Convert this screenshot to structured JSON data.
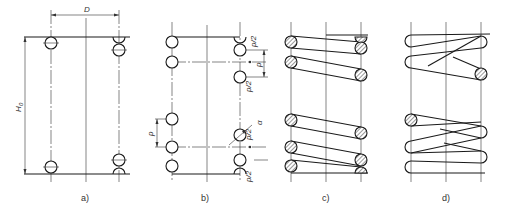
{
  "figure": {
    "panels": [
      {
        "id": "a",
        "label": "a)",
        "dimensions": {
          "diameter": "D",
          "free_height": "H0"
        }
      },
      {
        "id": "b",
        "label": "b)",
        "dimensions": {
          "pitch": "p",
          "half_pitch_top": "p/2",
          "half_pitch_mid": "p/2",
          "half_pitch_upper": "p/2",
          "half_pitch_bottom": "p/2",
          "angle": "α"
        }
      },
      {
        "id": "c",
        "label": "c)"
      },
      {
        "id": "d",
        "label": "d)"
      }
    ]
  },
  "labels": {
    "a": "a)",
    "b": "b)",
    "c": "c)",
    "d": "d)",
    "D": "D",
    "H0": "H",
    "H0_sub": "0",
    "p": "p",
    "p2a": "p/2",
    "p2b": "p/2",
    "p2c": "p/2",
    "p2d": "p/2",
    "alpha": "α"
  }
}
